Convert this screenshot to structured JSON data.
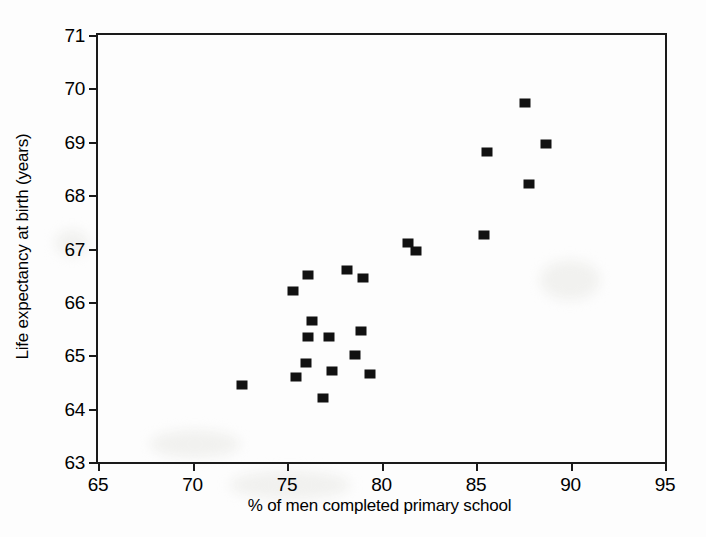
{
  "chart_data": {
    "type": "scatter",
    "title": "",
    "xlabel": "% of men completed primary school",
    "ylabel": "Life expectancy at birth (years)",
    "xlim": [
      65,
      95
    ],
    "ylim": [
      63,
      71
    ],
    "xticks": [
      65,
      70,
      75,
      80,
      85,
      90,
      95
    ],
    "yticks": [
      63,
      64,
      65,
      66,
      67,
      68,
      69,
      70,
      71
    ],
    "grid": false,
    "legend": null,
    "marker": {
      "shape": "filled-square",
      "color": "#111111",
      "width_px": 11,
      "height_px": 9
    },
    "points": [
      {
        "x": 72.6,
        "y": 64.45
      },
      {
        "x": 75.3,
        "y": 66.2
      },
      {
        "x": 75.5,
        "y": 64.6
      },
      {
        "x": 76.1,
        "y": 66.5
      },
      {
        "x": 76.0,
        "y": 64.85
      },
      {
        "x": 76.3,
        "y": 65.65
      },
      {
        "x": 76.1,
        "y": 65.35
      },
      {
        "x": 77.2,
        "y": 65.35
      },
      {
        "x": 76.9,
        "y": 64.2
      },
      {
        "x": 77.4,
        "y": 64.7
      },
      {
        "x": 78.2,
        "y": 66.6
      },
      {
        "x": 78.6,
        "y": 65.0
      },
      {
        "x": 79.0,
        "y": 66.45
      },
      {
        "x": 78.9,
        "y": 65.45
      },
      {
        "x": 79.4,
        "y": 64.65
      },
      {
        "x": 81.4,
        "y": 67.1
      },
      {
        "x": 81.8,
        "y": 66.95
      },
      {
        "x": 85.4,
        "y": 67.25
      },
      {
        "x": 85.6,
        "y": 68.8
      },
      {
        "x": 87.6,
        "y": 69.72
      },
      {
        "x": 87.8,
        "y": 68.2
      },
      {
        "x": 88.7,
        "y": 68.95
      }
    ]
  }
}
